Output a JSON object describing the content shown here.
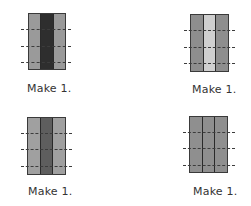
{
  "figures": [
    {
      "caption": "Make 1.",
      "strips": [
        "#9a9a9a",
        "#2e2e2e",
        "#9a9a9a"
      ],
      "fold_lines": 3
    },
    {
      "caption": "Make 1.",
      "strips": [
        "#8e8e8e",
        "#cfcfcf",
        "#8e8e8e"
      ],
      "fold_lines": 3
    },
    {
      "caption": "Make 1.",
      "strips": [
        "#a0a0a0",
        "#5e5e5e",
        "#a0a0a0"
      ],
      "fold_lines": 3
    },
    {
      "caption": "Make 1.",
      "strips": [
        "#8f8f8f",
        "#8f8f8f",
        "#8f8f8f"
      ],
      "fold_lines": 3
    }
  ],
  "colors": {
    "border": "#3a3a3a",
    "dash": "#3c3c3c",
    "text": "#333333"
  }
}
